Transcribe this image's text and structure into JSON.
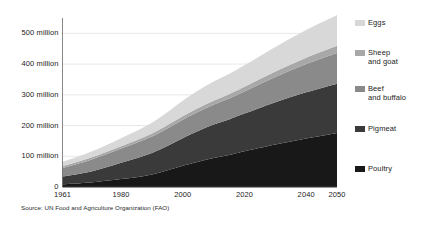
{
  "chart_data": {
    "type": "area",
    "stacked": true,
    "title": "",
    "subtitle": "",
    "xlabel": "",
    "ylabel": "",
    "xlim": [
      1961,
      2050
    ],
    "ylim": [
      0,
      550
    ],
    "y_unit": "million",
    "grid": true,
    "legend_position": "right",
    "source": "Source: UN Food and Agriculture Organization (FAO)",
    "x_ticks": [
      {
        "value": 1961,
        "label": "1961"
      },
      {
        "value": 1980,
        "label": "1980"
      },
      {
        "value": 2000,
        "label": "2000"
      },
      {
        "value": 2020,
        "label": "2020"
      },
      {
        "value": 2040,
        "label": "2040"
      },
      {
        "value": 2050,
        "label": "2050"
      }
    ],
    "y_ticks": [
      {
        "value": 0,
        "label": "0"
      },
      {
        "value": 100,
        "label": "100 million"
      },
      {
        "value": 200,
        "label": "200 million"
      },
      {
        "value": 300,
        "label": "300 million"
      },
      {
        "value": 400,
        "label": "400 million"
      },
      {
        "value": 500,
        "label": "500 million"
      }
    ],
    "x": [
      1961,
      1970,
      1980,
      1990,
      2000,
      2005,
      2010,
      2015,
      2020,
      2030,
      2040,
      2050
    ],
    "series": [
      {
        "name": "Poultry",
        "color": "#181818",
        "values": [
          9,
          15,
          26,
          41,
          69,
          82,
          94,
          104,
          116,
          138,
          158,
          176
        ]
      },
      {
        "name": "Pigmeat",
        "color": "#3a3a3a",
        "values": [
          25,
          35,
          53,
          70,
          90,
          100,
          109,
          116,
          123,
          138,
          150,
          160
        ]
      },
      {
        "name": "Beef and buffalo",
        "color": "#8a8a8a",
        "values": [
          28,
          38,
          46,
          53,
          60,
          63,
          65,
          68,
          72,
          82,
          92,
          100
        ]
      },
      {
        "name": "Sheep and goat",
        "color": "#a8a8a8",
        "values": [
          6,
          7,
          8,
          10,
          11,
          12,
          13,
          14,
          15,
          18,
          21,
          24
        ]
      },
      {
        "name": "Eggs",
        "color": "#d8d8d8",
        "values": [
          14,
          19,
          26,
          35,
          51,
          57,
          62,
          66,
          70,
          80,
          90,
          100
        ]
      }
    ]
  },
  "legend": {
    "items": [
      {
        "label": "Eggs",
        "color": "#d8d8d8"
      },
      {
        "label": "Sheep\nand goat",
        "color": "#a8a8a8"
      },
      {
        "label": "Beef\nand buffalo",
        "color": "#8a8a8a"
      },
      {
        "label": "Pigmeat",
        "color": "#3a3a3a"
      },
      {
        "label": "Poultry",
        "color": "#181818"
      }
    ]
  },
  "source_note": "Source: UN Food and Agriculture Organization (FAO)"
}
